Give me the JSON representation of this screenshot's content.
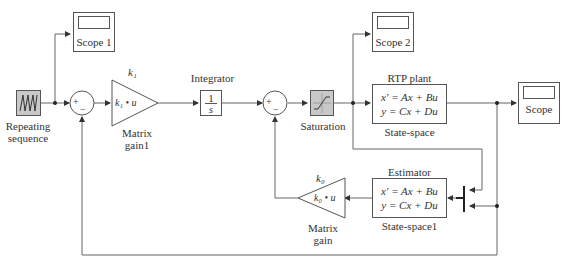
{
  "blocks": {
    "repeating_sequence": {
      "label_line1": "Repeating",
      "label_line2": "sequence"
    },
    "scope1": {
      "label": "Scope 1"
    },
    "scope2": {
      "label": "Scope 2"
    },
    "scope": {
      "label": "Scope"
    },
    "sum1": {
      "plus": "+",
      "minus": "−"
    },
    "sum2": {
      "plus": "+",
      "minus": "−"
    },
    "matrix_gain1": {
      "top": "k₁",
      "inside": "k₁ • u",
      "label_line1": "Matrix",
      "label_line2": "gain1"
    },
    "integrator": {
      "title": "Integrator",
      "num": "1",
      "den": "s"
    },
    "saturation": {
      "label": "Saturation"
    },
    "rtp_plant": {
      "title": "RTP plant",
      "eq1": "x′ = Ax + Bu",
      "eq2": "y = Cx + Du",
      "label": "State-space"
    },
    "estimator": {
      "title": "Estimator",
      "eq1": "x′ = Ax + Bu",
      "eq2": "y = Cx + Du",
      "label": "State-space1"
    },
    "matrix_gain": {
      "top": "k₀",
      "inside": "k₀ • u",
      "label_line1": "Matrix",
      "label_line2": "gain"
    }
  },
  "colors": {
    "line": "#666666",
    "block_border": "#555555",
    "shaded_block": "#c8c8c8"
  }
}
